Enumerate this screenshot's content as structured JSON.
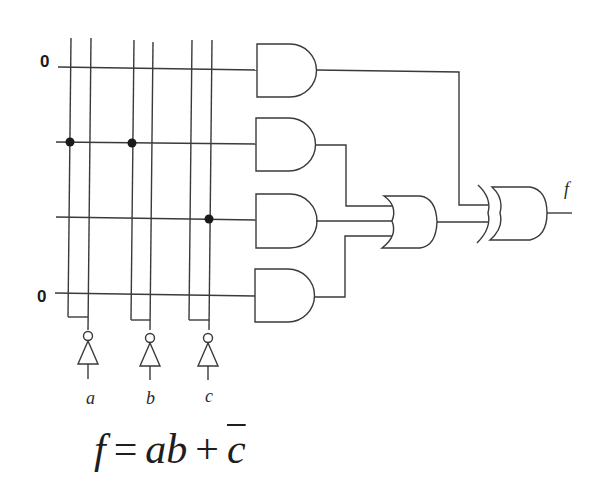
{
  "diagram": {
    "type": "PLA logic circuit",
    "row_constants": [
      {
        "row": 1,
        "label": "0"
      },
      {
        "row": 4,
        "label": "0"
      }
    ],
    "inputs": [
      {
        "name": "a",
        "label": "a"
      },
      {
        "name": "b",
        "label": "b"
      },
      {
        "name": "c",
        "label": "c"
      }
    ],
    "and_gates": [
      {
        "id": "and1",
        "connections": []
      },
      {
        "id": "and2",
        "connections": [
          "a",
          "b"
        ]
      },
      {
        "id": "and3",
        "connections": [
          "c_bar"
        ]
      },
      {
        "id": "and4",
        "connections": []
      }
    ],
    "or_gate": {
      "inputs": [
        "and2",
        "and3",
        "and4"
      ]
    },
    "xor_gate": {
      "inputs": [
        "and1",
        "or"
      ],
      "output_label": "f"
    }
  },
  "formula": {
    "lhs": "f",
    "equals": "=",
    "term1": "ab",
    "plus": "+",
    "term2": "c",
    "term2_complemented": true
  }
}
